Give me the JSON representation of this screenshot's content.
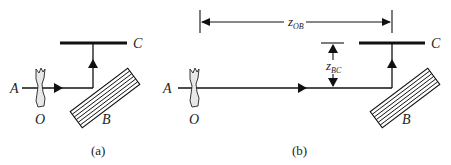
{
  "figure": {
    "panels": [
      {
        "id": "a",
        "caption": "(a)",
        "labels": {
          "source": "A",
          "object": "O",
          "grating": "B",
          "screen": "C"
        }
      },
      {
        "id": "b",
        "caption": "(b)",
        "labels": {
          "source": "A",
          "object": "O",
          "grating": "B",
          "screen": "C"
        },
        "dimensions": {
          "z_ob": {
            "symbol": "z",
            "subscript": "OB"
          },
          "z_bc": {
            "symbol": "z",
            "subscript": "BC"
          }
        }
      }
    ]
  },
  "colors": {
    "line": "#111111",
    "object_fill": "#e8e8e8",
    "text": "#222222"
  }
}
